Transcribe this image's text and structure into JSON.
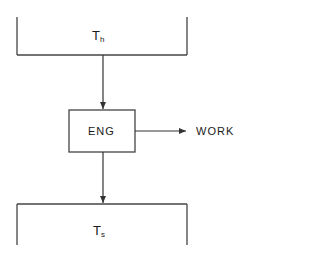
{
  "diagram": {
    "type": "heat-engine-schematic",
    "hot_reservoir": {
      "label_main": "T",
      "label_sub": "h"
    },
    "engine": {
      "label": "ENG"
    },
    "work_output": {
      "label": "WORK"
    },
    "cold_reservoir": {
      "label_main": "T",
      "label_sub": "s"
    },
    "colors": {
      "line": "#333333",
      "background": "#ffffff",
      "text": "#1a1a1a"
    }
  }
}
